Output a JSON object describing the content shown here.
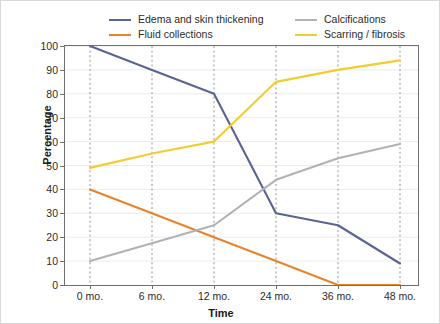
{
  "chart_data": {
    "type": "line",
    "title": "",
    "xlabel": "Time",
    "ylabel": "Percentage",
    "categories": [
      "0 mo.",
      "6 mo.",
      "12 mo.",
      "24 mo.",
      "36 mo.",
      "48 mo."
    ],
    "x_values": [
      0,
      6,
      12,
      24,
      36,
      48
    ],
    "ylim": [
      0,
      100
    ],
    "yticks": [
      0,
      10,
      20,
      30,
      40,
      50,
      60,
      70,
      80,
      90,
      100
    ],
    "ytick_labels": [
      "0",
      "10",
      "20",
      "30",
      "40",
      "50",
      "60",
      "70",
      "80",
      "90",
      "100"
    ],
    "grid": "horizontal-solid-light, vertical-dashed-at-categories",
    "legend_position": "top",
    "series": [
      {
        "name": "Edema and skin thickening",
        "color": "#5a6494",
        "values": [
          100,
          90,
          80,
          30,
          25,
          9
        ]
      },
      {
        "name": "Fluid collections",
        "color": "#e8832a",
        "values": [
          40,
          30,
          20,
          10,
          0,
          0
        ]
      },
      {
        "name": "Calcifications",
        "color": "#b2b2b2",
        "values": [
          10,
          17.5,
          25,
          44,
          53,
          59
        ]
      },
      {
        "name": "Scarring / fibrosis",
        "color": "#f3cd2e",
        "values": [
          49,
          55,
          60,
          85,
          90,
          94
        ]
      }
    ]
  },
  "legend": {
    "items": [
      {
        "label": "Edema and skin thickening",
        "color": "#5a6494"
      },
      {
        "label": "Fluid collections",
        "color": "#e8832a"
      },
      {
        "label": "Calcifications",
        "color": "#b2b2b2"
      },
      {
        "label": "Scarring / fibrosis",
        "color": "#f3cd2e"
      }
    ]
  },
  "axes": {
    "y_title": "Percentage",
    "x_title": "Time"
  },
  "colors": {
    "axis": "#6f6f6f",
    "grid_h": "#ececec",
    "grid_v": "#8a8a8a",
    "text": "#2b2b2b",
    "frame": "#d8d8d8"
  }
}
